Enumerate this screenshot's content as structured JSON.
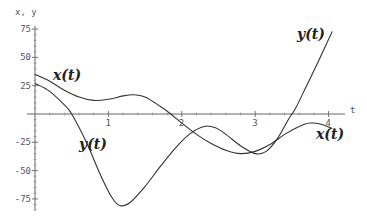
{
  "chart_data": {
    "type": "line",
    "title": "",
    "xlabel": "t",
    "ylabel": "x, y",
    "xlim": [
      0,
      4.15
    ],
    "ylim": [
      -85,
      80
    ],
    "x_ticks": [
      "1",
      "2",
      "3",
      "4"
    ],
    "y_ticks": [
      "75",
      "50",
      "25",
      "-25",
      "-50",
      "-75"
    ],
    "grid": false,
    "legend": "inline curve labels",
    "series": [
      {
        "name": "x(t)",
        "label": "x(t)",
        "points": [
          [
            0,
            35
          ],
          [
            0.2,
            29
          ],
          [
            0.4,
            21
          ],
          [
            0.6,
            15
          ],
          [
            0.8,
            12
          ],
          [
            1.0,
            13
          ],
          [
            1.2,
            16
          ],
          [
            1.35,
            17
          ],
          [
            1.5,
            15
          ],
          [
            1.7,
            7
          ],
          [
            1.85,
            0
          ],
          [
            2.0,
            -8
          ],
          [
            2.2,
            -18
          ],
          [
            2.4,
            -26
          ],
          [
            2.6,
            -32
          ],
          [
            2.8,
            -35
          ],
          [
            3.0,
            -33
          ],
          [
            3.2,
            -27
          ],
          [
            3.4,
            -18
          ],
          [
            3.6,
            -11
          ],
          [
            3.75,
            -8
          ],
          [
            3.9,
            -9
          ],
          [
            4.05,
            -13
          ]
        ]
      },
      {
        "name": "y(t)",
        "label": "y(t)",
        "points": [
          [
            0,
            27
          ],
          [
            0.2,
            20
          ],
          [
            0.4,
            8
          ],
          [
            0.5,
            0
          ],
          [
            0.7,
            -25
          ],
          [
            0.9,
            -55
          ],
          [
            1.05,
            -74
          ],
          [
            1.16,
            -81
          ],
          [
            1.3,
            -78
          ],
          [
            1.5,
            -64
          ],
          [
            1.7,
            -47
          ],
          [
            1.9,
            -31
          ],
          [
            2.1,
            -18
          ],
          [
            2.3,
            -11
          ],
          [
            2.45,
            -12
          ],
          [
            2.6,
            -18
          ],
          [
            2.8,
            -28
          ],
          [
            3.0,
            -35
          ],
          [
            3.15,
            -33
          ],
          [
            3.3,
            -22
          ],
          [
            3.45,
            -5
          ],
          [
            3.55,
            5
          ],
          [
            3.7,
            25
          ],
          [
            3.85,
            45
          ],
          [
            4.05,
            73
          ]
        ]
      }
    ],
    "annotations": [
      {
        "text": "x(t)",
        "t": 0.85,
        "v": 33
      },
      {
        "text": "y(t)",
        "t": 0.7,
        "v": -28
      },
      {
        "text": "y(t)",
        "t": 3.65,
        "v": 68
      },
      {
        "text": "x(t)",
        "t": 3.85,
        "v": -19
      }
    ]
  },
  "labels": {
    "y_axis": "x, y",
    "x_axis": "t",
    "x_curve_label_top": "x(t)",
    "y_curve_label_bottom": "y(t)",
    "y_curve_label_right": "y(t)",
    "x_curve_label_right": "x(t)"
  }
}
